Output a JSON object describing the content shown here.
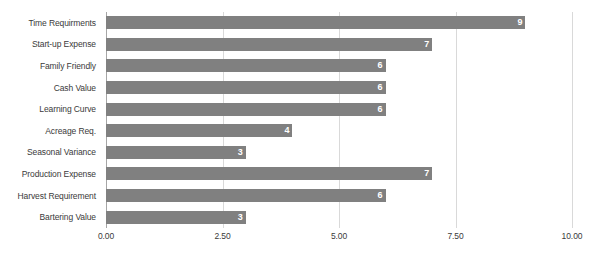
{
  "chart_data": {
    "type": "bar",
    "orientation": "horizontal",
    "title": "",
    "subtitle": "",
    "xlabel": "",
    "ylabel": "",
    "xlim": [
      0,
      10
    ],
    "grid": true,
    "legend": false,
    "legend_position": "none",
    "bar_color": "#808080",
    "gridline_color": "#d9d9d9",
    "axis_color": "#a6a6a6",
    "value_label_color": "#ffffff",
    "tick_label_color": "#3a3a3a",
    "categories": [
      "Time Requirments",
      "Start-up Expense",
      "Family Friendly",
      "Cash Value",
      "Learning Curve",
      "Acreage Req.",
      "Seasonal Variance",
      "Production Expense",
      "Harvest Requirement",
      "Bartering Value"
    ],
    "values": [
      9,
      7,
      6,
      6,
      6,
      4,
      3,
      7,
      6,
      3
    ],
    "value_labels": [
      "9",
      "7",
      "6",
      "6",
      "6",
      "4",
      "3",
      "7",
      "6",
      "3"
    ],
    "xticks": [
      0,
      2.5,
      5,
      7.5,
      10
    ],
    "xtick_labels": [
      "0.00",
      "2.50",
      "5.00",
      "7.50",
      "10.00"
    ]
  }
}
